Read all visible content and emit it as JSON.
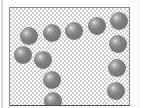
{
  "thumbnail": {
    "type": "transparent-image-preview",
    "background": "checkerboard",
    "sphere_color": "#707070",
    "spheres": [
      {
        "cx": 19,
        "cy": 28,
        "r": 9
      },
      {
        "cx": 42,
        "cy": 25,
        "r": 9
      },
      {
        "cx": 64,
        "cy": 23,
        "r": 9
      },
      {
        "cx": 87,
        "cy": 18,
        "r": 9
      },
      {
        "cx": 109,
        "cy": 13,
        "r": 9
      },
      {
        "cx": 13,
        "cy": 47,
        "r": 9
      },
      {
        "cx": 33,
        "cy": 52,
        "r": 9
      },
      {
        "cx": 42,
        "cy": 72,
        "r": 9
      },
      {
        "cx": 43,
        "cy": 93,
        "r": 9
      },
      {
        "cx": 108,
        "cy": 36,
        "r": 9
      },
      {
        "cx": 107,
        "cy": 60,
        "r": 9
      },
      {
        "cx": 106,
        "cy": 83,
        "r": 9
      }
    ]
  }
}
